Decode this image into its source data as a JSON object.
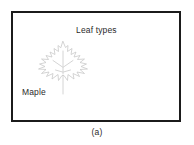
{
  "figure": {
    "caption": "(a)",
    "frame": {
      "border_color": "#1b1b1b",
      "background_color": "#ffffff"
    },
    "panel": {
      "title": "Leaf types",
      "species_label": "Maple",
      "illustration": {
        "name": "maple-leaf-drawing",
        "stroke_color": "#c9c9c9",
        "fill_color": "#ffffff",
        "description": "Maple leaf outline with stem and veins"
      }
    }
  }
}
